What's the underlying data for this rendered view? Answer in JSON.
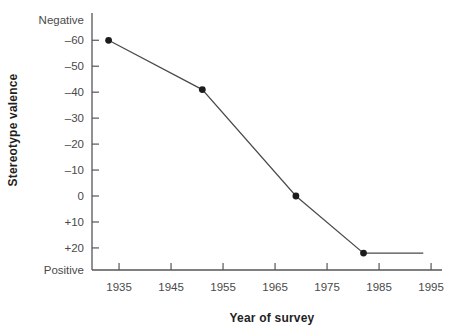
{
  "chart_data": {
    "type": "line",
    "title": "",
    "xlabel": "Year of survey",
    "ylabel": "Stereotype valence",
    "x_ticks": [
      1935,
      1945,
      1955,
      1965,
      1975,
      1985,
      1995
    ],
    "y_ticks": [
      {
        "value": -60,
        "label": "–60"
      },
      {
        "value": -50,
        "label": "–50"
      },
      {
        "value": -40,
        "label": "–40"
      },
      {
        "value": -30,
        "label": "–30"
      },
      {
        "value": -20,
        "label": "–20"
      },
      {
        "value": -10,
        "label": "–10"
      },
      {
        "value": 0,
        "label": "0"
      },
      {
        "value": 10,
        "label": "+10"
      },
      {
        "value": 20,
        "label": "+20"
      }
    ],
    "y_axis_top_label": "Negative",
    "y_axis_bottom_label": "Positive",
    "y_inverted": true,
    "grid": false,
    "legend": "none",
    "xlim": [
      1929.8,
      1997.1
    ],
    "ylim": [
      -70.5,
      28.5
    ],
    "series": [
      {
        "name": "stereotype-valence-over-time",
        "points": [
          {
            "x": 1933,
            "y": -60,
            "marker": true
          },
          {
            "x": 1951,
            "y": -41,
            "marker": true
          },
          {
            "x": 1969,
            "y": 0,
            "marker": true
          },
          {
            "x": 1982,
            "y": 22,
            "marker": true
          },
          {
            "x": 1993.5,
            "y": 22,
            "marker": false
          }
        ]
      }
    ],
    "colors": {
      "background": "#ffffff",
      "axis": "#565656",
      "line": "#4a4a4a",
      "marker": "#1c1c1c",
      "tick_label": "#4a4a4a",
      "endpoint_label": "#4a4a4a",
      "title": "#1f1f1f"
    }
  }
}
